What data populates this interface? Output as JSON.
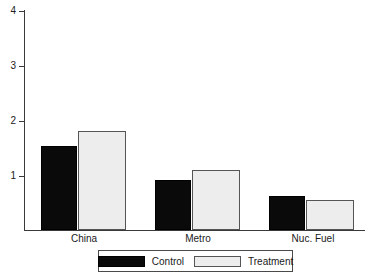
{
  "chart_data": {
    "type": "bar",
    "title": "",
    "subtitle": "",
    "xlabel": "",
    "ylabel": "",
    "categories": [
      "China",
      "Metro",
      "Nuc. Fuel"
    ],
    "series": [
      {
        "name": "Control",
        "values": [
          1.53,
          0.91,
          0.62
        ],
        "color": "#0a0a0a"
      },
      {
        "name": "Treatment",
        "values": [
          1.8,
          1.09,
          0.55
        ],
        "color": "#ededed"
      }
    ],
    "ylim": [
      0,
      4.2
    ],
    "yticks": [
      1,
      2,
      3,
      4
    ],
    "ytick_labels": [
      "1",
      "2",
      "3",
      "4"
    ],
    "grid": false,
    "legend_position": "bottom",
    "legend_entries": [
      "Control",
      "Treatment"
    ]
  },
  "axis": {
    "y_ticks": [
      {
        "label": "4",
        "value": 4
      },
      {
        "label": "3",
        "value": 3
      },
      {
        "label": "2",
        "value": 2
      },
      {
        "label": "1",
        "value": 1
      }
    ]
  },
  "groups": [
    {
      "label": "China",
      "control": "1.53",
      "treatment": "1.80"
    },
    {
      "label": "Metro",
      "control": "0.91",
      "treatment": "1.09"
    },
    {
      "label": "Nuc. Fuel",
      "control": "0.62",
      "treatment": "0.55"
    }
  ],
  "legend": {
    "items": [
      {
        "label": "Control",
        "color": "#0a0a0a"
      },
      {
        "label": "Treatment",
        "color": "#ededed"
      }
    ]
  }
}
